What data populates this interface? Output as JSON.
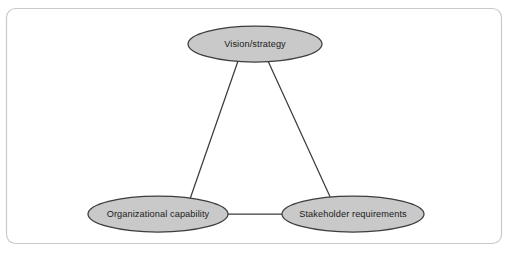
{
  "diagram": {
    "type": "triangle-relationship-diagram",
    "frame": {
      "border_color": "#c9c9c9",
      "background_color": "#ffffff",
      "corner_radius": 9
    },
    "style": {
      "node_fill": "#c9c9c9",
      "node_stroke": "#3d3d3d",
      "connector_color": "#3d3d3d",
      "label_color": "#1a1a1a"
    },
    "nodes": [
      {
        "id": "vision-strategy",
        "label": "Vision/strategy",
        "cx": 255,
        "cy": 44,
        "rx": 67,
        "ry": 18
      },
      {
        "id": "organizational-capability",
        "label": "Organizational capability",
        "cx": 158,
        "cy": 214,
        "rx": 70,
        "ry": 18
      },
      {
        "id": "stakeholder-requirements",
        "label": "Stakeholder requirements",
        "cx": 353,
        "cy": 214,
        "rx": 71,
        "ry": 18
      }
    ],
    "connectors": [
      {
        "id": "vision-to-capability",
        "from": "vision-strategy",
        "to": "organizational-capability",
        "x1": 238,
        "y1": 61,
        "x2": 190,
        "y2": 199
      },
      {
        "id": "vision-to-stakeholder",
        "from": "vision-strategy",
        "to": "stakeholder-requirements",
        "x1": 268,
        "y1": 61,
        "x2": 332,
        "y2": 201
      },
      {
        "id": "capability-to-stakeholder",
        "from": "organizational-capability",
        "to": "stakeholder-requirements",
        "x1": 228,
        "y1": 214,
        "x2": 282,
        "y2": 214
      }
    ]
  }
}
